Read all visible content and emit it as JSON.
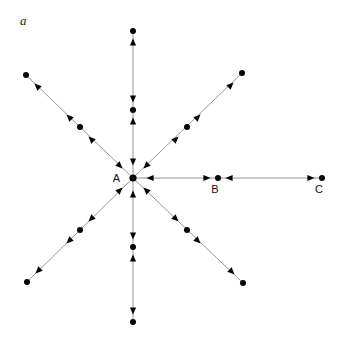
{
  "figure": {
    "panel_label": "a",
    "background_color": "#ffffff",
    "line_color": "#8a8a8a",
    "dot_color": "#050505",
    "arrow_color": "#050505",
    "label_color": "#111111",
    "width": 339,
    "height": 356
  },
  "center": {
    "label": "A",
    "x": 133,
    "y": 178,
    "dot_radius": 3.6,
    "label_dx": -13,
    "label_dy": 4
  },
  "labeled_points": [
    {
      "name": "B",
      "x": 218,
      "y": 178,
      "label_dx": -3,
      "label_dy": 15
    },
    {
      "name": "C",
      "x": 322,
      "y": 178,
      "label_dx": -3,
      "label_dy": 15
    }
  ],
  "rays": [
    {
      "id": "north",
      "direction_deg": 90,
      "angle_label": "up",
      "mid_dot": {
        "x": 133,
        "y": 110,
        "r": 3.0
      },
      "outer_dot": {
        "x": 133,
        "y": 31,
        "r": 3.0
      },
      "arrows": [
        {
          "x": 133,
          "y": 162,
          "dir": "down",
          "note": "into-center"
        },
        {
          "x": 133,
          "y": 99,
          "dir": "down",
          "note": "into-mid-dot"
        },
        {
          "x": 133,
          "y": 121,
          "dir": "up",
          "note": "into-mid-dot"
        },
        {
          "x": 133,
          "y": 42,
          "dir": "up",
          "note": "into-outer-dot"
        }
      ]
    },
    {
      "id": "south",
      "direction_deg": 270,
      "angle_label": "down",
      "mid_dot": {
        "x": 133,
        "y": 247,
        "r": 3.0
      },
      "outer_dot": {
        "x": 133,
        "y": 322,
        "r": 3.0
      },
      "arrows": [
        {
          "x": 133,
          "y": 194,
          "dir": "up",
          "note": "into-center"
        },
        {
          "x": 133,
          "y": 236,
          "dir": "down",
          "note": "into-mid-dot"
        },
        {
          "x": 133,
          "y": 258,
          "dir": "up",
          "note": "into-mid-dot"
        },
        {
          "x": 133,
          "y": 311,
          "dir": "down",
          "note": "into-outer-dot"
        }
      ]
    },
    {
      "id": "east",
      "direction_deg": 0,
      "angle_label": "right",
      "mid_dot": {
        "x": 218,
        "y": 178,
        "r": 3.0
      },
      "outer_dot": {
        "x": 322,
        "y": 178,
        "r": 3.0
      },
      "arrows": [
        {
          "x": 150,
          "y": 178,
          "dir": "left",
          "note": "into-center"
        },
        {
          "x": 207,
          "y": 178,
          "dir": "right",
          "note": "into-B"
        },
        {
          "x": 229,
          "y": 178,
          "dir": "left",
          "note": "into-B"
        },
        {
          "x": 311,
          "y": 178,
          "dir": "right",
          "note": "into-C"
        }
      ]
    },
    {
      "id": "northeast",
      "direction_deg": 45,
      "angle_label": "up-right",
      "mid_dot": {
        "x": 187,
        "y": 127,
        "r": 3.0
      },
      "outer_dot": {
        "x": 242,
        "y": 73,
        "r": 3.0
      },
      "arrows": [
        {
          "x": 146,
          "y": 166,
          "dir": "down-left",
          "note": "into-center"
        },
        {
          "x": 176,
          "y": 139,
          "dir": "up-right",
          "note": "outward"
        },
        {
          "x": 198,
          "y": 117,
          "dir": "up-right",
          "note": "outward"
        },
        {
          "x": 231,
          "y": 85,
          "dir": "up-right",
          "note": "into-outer-dot"
        }
      ]
    },
    {
      "id": "northwest",
      "direction_deg": 135,
      "angle_label": "up-left",
      "mid_dot": {
        "x": 80,
        "y": 127,
        "r": 3.0
      },
      "outer_dot": {
        "x": 26,
        "y": 75,
        "r": 3.0
      },
      "arrows": [
        {
          "x": 120,
          "y": 166,
          "dir": "down-right",
          "note": "into-center"
        },
        {
          "x": 91,
          "y": 139,
          "dir": "up-left",
          "note": "outward"
        },
        {
          "x": 69,
          "y": 117,
          "dir": "up-left",
          "note": "outward"
        },
        {
          "x": 37,
          "y": 86,
          "dir": "up-left",
          "note": "into-outer-dot"
        }
      ]
    },
    {
      "id": "southeast",
      "direction_deg": 315,
      "angle_label": "down-right",
      "mid_dot": {
        "x": 187,
        "y": 230,
        "r": 3.0
      },
      "outer_dot": {
        "x": 243,
        "y": 283,
        "r": 3.0
      },
      "arrows": [
        {
          "x": 146,
          "y": 190,
          "dir": "up-left",
          "note": "into-center"
        },
        {
          "x": 176,
          "y": 219,
          "dir": "down-right",
          "note": "outward"
        },
        {
          "x": 198,
          "y": 241,
          "dir": "down-right",
          "note": "outward"
        },
        {
          "x": 232,
          "y": 272,
          "dir": "down-right",
          "note": "into-outer-dot"
        }
      ]
    },
    {
      "id": "southwest",
      "direction_deg": 225,
      "angle_label": "down-left",
      "mid_dot": {
        "x": 80,
        "y": 230,
        "r": 3.0
      },
      "outer_dot": {
        "x": 27,
        "y": 282,
        "r": 3.0
      },
      "arrows": [
        {
          "x": 120,
          "y": 190,
          "dir": "up-right",
          "note": "into-center"
        },
        {
          "x": 91,
          "y": 219,
          "dir": "down-left",
          "note": "outward"
        },
        {
          "x": 69,
          "y": 241,
          "dir": "down-left",
          "note": "outward"
        },
        {
          "x": 38,
          "y": 271,
          "dir": "down-left",
          "note": "into-outer-dot"
        }
      ]
    }
  ]
}
